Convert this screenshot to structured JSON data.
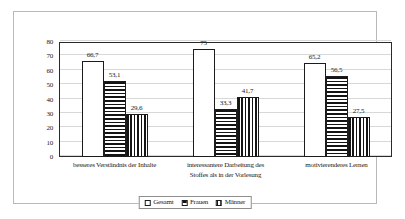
{
  "chart_data": {
    "type": "bar",
    "title": "",
    "subtitle": "",
    "xlabel": "",
    "ylabel": "",
    "ylim": [
      0,
      80
    ],
    "ytick_step": 10,
    "yticks": [
      "0",
      "10",
      "20",
      "30",
      "40",
      "50",
      "60",
      "70",
      "80"
    ],
    "grid": true,
    "legend_position": "bottom",
    "value_labels_shown": true,
    "decimal_separator": ",",
    "categories": [
      "besseres Verständnis der Inhalte",
      "interessantere Darbeitung des Stoffes als in der Vorlesung",
      "motivierenderes Lernen"
    ],
    "category_lines": [
      [
        "besseres Verständnis der Inhalte"
      ],
      [
        "interessantere Darbeitung des",
        "Stoffes als in der Vorlesung"
      ],
      [
        "motivierenderes Lernen"
      ]
    ],
    "series": [
      {
        "name": "Gesamt",
        "pattern": "solid-white",
        "color": "#ffffff",
        "values": [
          66.7,
          75,
          65.2
        ],
        "labels": [
          "66,7",
          "75",
          "65,2"
        ]
      },
      {
        "name": "Frauen",
        "pattern": "horizontal-stripes",
        "color": "#141414",
        "values": [
          53.1,
          33.3,
          56.5
        ],
        "labels": [
          "53,1",
          "33,3",
          "56,5"
        ]
      },
      {
        "name": "Männer",
        "pattern": "vertical-stripes",
        "color": "#141414",
        "values": [
          29.6,
          41.7,
          27.5
        ],
        "labels": [
          "29,6",
          "41,7",
          "27,5"
        ]
      }
    ],
    "grouped_values": [
      {
        "category": "besseres Verständnis der Inhalte",
        "Gesamt": 66.7,
        "Frauen": 75,
        "Männer": 65.2
      },
      {
        "category": "interessantere Darbeitung des Stoffes als in der Vorlesung",
        "Gesamt": 53.1,
        "Frauen": 33.3,
        "Männer": 56.5
      },
      {
        "category": "motivierenderes Lernen",
        "Gesamt": 29.6,
        "Frauen": 41.7,
        "Männer": 27.5
      }
    ]
  },
  "legend": {
    "items": [
      {
        "label": "Gesamt"
      },
      {
        "label": "Frauen"
      },
      {
        "label": "Männer"
      }
    ]
  }
}
